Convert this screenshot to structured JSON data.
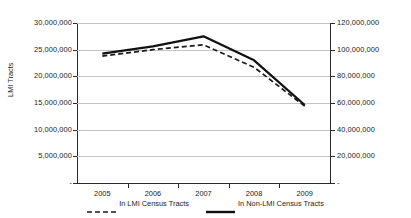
{
  "chart_data": {
    "type": "line",
    "title": "",
    "xlabel": "",
    "ylabel": "LMI Tracts",
    "y2label": "",
    "categories": [
      "2005",
      "2006",
      "2007",
      "2008",
      "2009"
    ],
    "x_tick_labels": [
      "2005",
      "2006",
      "2007",
      "2008",
      "2009"
    ],
    "grid": true,
    "legend_position": "bottom",
    "axes": {
      "left": {
        "label": "LMI Tracts",
        "min": 0,
        "max": 30000000,
        "step": 5000000,
        "tick_labels": [
          "30,000,000",
          "25,000,000",
          "20,000,000",
          "15,000,000",
          "10,000,000",
          "5,000,000",
          "-"
        ],
        "tick_values": [
          30000000,
          25000000,
          20000000,
          15000000,
          10000000,
          5000000,
          0
        ]
      },
      "right": {
        "label": "",
        "min": 0,
        "max": 120000000,
        "step": 20000000,
        "tick_labels": [
          "120,000,000",
          "100,000,000",
          "80,000,000",
          "60,000,000",
          "40,000,000",
          "20,000,000",
          "-"
        ],
        "tick_values": [
          120000000,
          100000000,
          80000000,
          60000000,
          40000000,
          20000000,
          0
        ]
      }
    },
    "series": [
      {
        "name": "In LMI Census Tracts",
        "axis": "left",
        "style": "dashed",
        "color": "#1a1a1a",
        "values": [
          23800000,
          25000000,
          25900000,
          21700000,
          14400000
        ]
      },
      {
        "name": "In Non-LMI Census Tracts",
        "axis": "right",
        "style": "solid",
        "color": "#111111",
        "values": [
          97000000,
          102500000,
          110000000,
          92000000,
          58500000
        ]
      }
    ]
  },
  "legend": {
    "items": [
      {
        "label": "In LMI Census Tracts",
        "style": "dashed"
      },
      {
        "label": "In Non-LMI Census Tracts",
        "style": "solid"
      }
    ]
  }
}
